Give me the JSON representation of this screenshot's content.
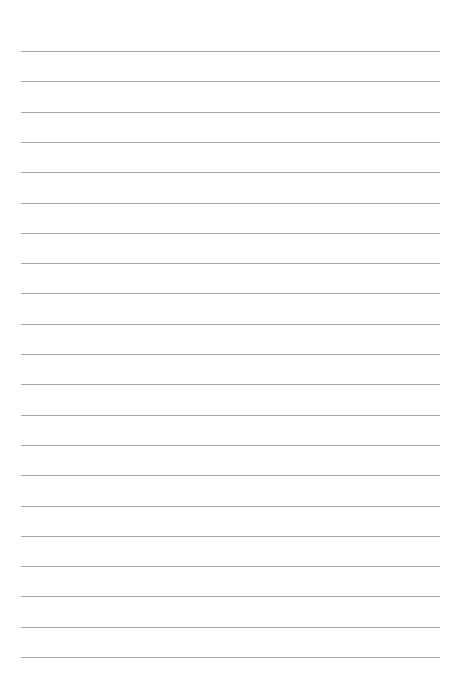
{
  "page": {
    "type": "lined-paper",
    "background_color": "#ffffff",
    "line_color": "#a8a8a8",
    "line_count": 21,
    "first_line_y": 51,
    "line_spacing": 30.3,
    "line_left": 21,
    "line_right": 440
  }
}
